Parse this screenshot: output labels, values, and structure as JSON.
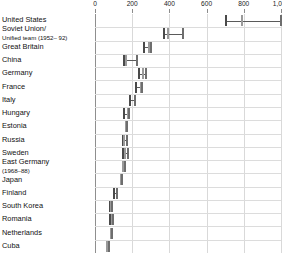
{
  "chart_data": {
    "type": "bar",
    "subtype": "range-dumbbell",
    "title": "",
    "xlabel": "",
    "ylabel": "",
    "xlim": [
      0,
      1000
    ],
    "grid": true,
    "legend": "none",
    "axis": {
      "ticks": [
        0,
        200,
        400,
        600,
        800,
        1000
      ],
      "tick_labels": [
        "0",
        "200",
        "400",
        "600",
        "800",
        "1,000"
      ]
    },
    "colors": {
      "gold": "#6e6e6e",
      "silver": "#9a9a9a",
      "bronze": "#4a4a4a",
      "connector": "#5a5a5a",
      "grid": "#dcdcdc",
      "axis": "#8f8f8f"
    },
    "categories": [
      "United States",
      "Soviet Union/ Unified team (1952–92)",
      "Great Britain",
      "China",
      "Germany",
      "France",
      "Italy",
      "Hungary",
      "Estonia",
      "Russia",
      "Sweden",
      "East Germany (1968–88)",
      "Japan",
      "Finland",
      "South Korea",
      "Romania",
      "Netherlands",
      "Cuba"
    ],
    "series": [
      {
        "name": "Gold",
        "values": [
          1000,
          473,
          263,
          224,
          275,
          223,
          216,
          181,
          173,
          155,
          148,
          160,
          147,
          104,
          91,
          89,
          85,
          73
        ]
      },
      {
        "name": "Silver",
        "values": [
          790,
          395,
          299,
          167,
          259,
          252,
          188,
          154,
          169,
          171,
          176,
          150,
          141,
          120,
          87,
          95,
          92,
          67
        ]
      },
      {
        "name": "Bronze",
        "values": [
          705,
          371,
          291,
          155,
          234,
          246,
          213,
          176,
          164,
          148,
          161,
          152,
          140,
          116,
          82,
          82,
          88,
          66
        ]
      }
    ]
  },
  "rows": [
    {
      "label": "United States",
      "sub": "",
      "ticks": [
        705,
        790,
        1000
      ],
      "connector": [
        705,
        1000
      ]
    },
    {
      "label": "Soviet Union/",
      "sub": "Unified team (1952– 92)",
      "ticks": [
        371,
        395,
        473
      ],
      "connector": [
        371,
        473
      ]
    },
    {
      "label": "Great Britain",
      "sub": "",
      "ticks": [
        263,
        291,
        299
      ],
      "connector": [
        263,
        299
      ]
    },
    {
      "label": "China",
      "sub": "",
      "ticks": [
        155,
        167,
        224
      ],
      "connector": [
        155,
        224
      ]
    },
    {
      "label": "Germany",
      "sub": "",
      "ticks": [
        234,
        259,
        275
      ],
      "connector": [
        234,
        275
      ]
    },
    {
      "label": "France",
      "sub": "",
      "ticks": [
        223,
        246,
        252
      ],
      "connector": [
        223,
        252
      ]
    },
    {
      "label": "Italy",
      "sub": "",
      "ticks": [
        188,
        213,
        216
      ],
      "connector": [
        188,
        216
      ]
    },
    {
      "label": "Hungary",
      "sub": "",
      "ticks": [
        154,
        176,
        181
      ],
      "connector": [
        154,
        181
      ]
    },
    {
      "label": "Estonia",
      "sub": "",
      "ticks": [
        164,
        169,
        173
      ],
      "connector": [
        164,
        173
      ]
    },
    {
      "label": "Russia",
      "sub": "",
      "ticks": [
        148,
        155,
        171
      ],
      "connector": [
        148,
        171
      ]
    },
    {
      "label": "Sweden",
      "sub": "",
      "ticks": [
        148,
        161,
        176
      ],
      "connector": [
        148,
        176
      ]
    },
    {
      "label": "East Germany",
      "sub": "(1968–88)",
      "ticks": [
        150,
        152,
        160
      ],
      "connector": [
        150,
        160
      ]
    },
    {
      "label": "Japan",
      "sub": "",
      "ticks": [
        140,
        141,
        147
      ],
      "connector": [
        140,
        147
      ]
    },
    {
      "label": "Finland",
      "sub": "",
      "ticks": [
        104,
        116,
        120
      ],
      "connector": [
        104,
        120
      ]
    },
    {
      "label": "South Korea",
      "sub": "",
      "ticks": [
        82,
        87,
        91
      ],
      "connector": [
        82,
        91
      ]
    },
    {
      "label": "Romania",
      "sub": "",
      "ticks": [
        82,
        89,
        95
      ],
      "connector": [
        82,
        95
      ]
    },
    {
      "label": "Netherlands",
      "sub": "",
      "ticks": [
        85,
        88,
        92
      ],
      "connector": [
        85,
        92
      ]
    },
    {
      "label": "Cuba",
      "sub": "",
      "ticks": [
        66,
        67,
        73
      ],
      "connector": [
        66,
        73
      ]
    }
  ]
}
